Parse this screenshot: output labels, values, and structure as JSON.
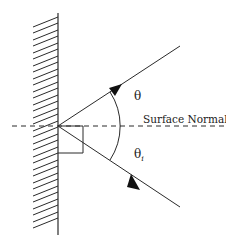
{
  "diagram": {
    "labels": {
      "reflected_angle": "θ",
      "incident_angle": "θ",
      "incident_subscript": "i",
      "normal": "Surface Normal"
    },
    "colors": {
      "line": "#2a2a2a",
      "background": "#ffffff"
    },
    "elements": {
      "surface": "hatched vertical wall",
      "normal_line": "dashed horizontal",
      "incident_ray": "arrow toward surface from lower right",
      "reflected_ray": "arrow away from surface toward upper right",
      "angle_arc": "arc spanning both rays",
      "right_angle_marker": "square at origin below normal"
    }
  }
}
